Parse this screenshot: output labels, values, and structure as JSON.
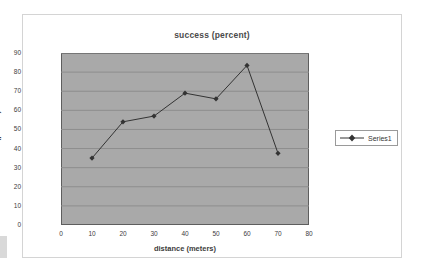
{
  "chart_data": {
    "type": "line",
    "title": "success (percent)",
    "xlabel": "distance (meters)",
    "ylabel": "Succes (percent)",
    "xlim": [
      0,
      80
    ],
    "ylim": [
      0,
      90
    ],
    "xticks": [
      0,
      10,
      20,
      30,
      40,
      50,
      60,
      70,
      80
    ],
    "yticks": [
      0,
      10,
      20,
      30,
      40,
      50,
      60,
      70,
      80,
      90
    ],
    "grid": "horizontal",
    "legend_position": "right",
    "plot_background": "#a9a9a9",
    "series": [
      {
        "name": "Series1",
        "marker": "diamond",
        "color": "#333333",
        "x": [
          10,
          20,
          30,
          40,
          50,
          60,
          70
        ],
        "values": [
          35,
          54,
          57,
          69,
          66,
          83.5,
          37.5
        ]
      }
    ]
  },
  "legend": {
    "entries": [
      {
        "label": "Series1"
      }
    ]
  },
  "icons": {
    "marker": "diamond-marker-icon"
  }
}
